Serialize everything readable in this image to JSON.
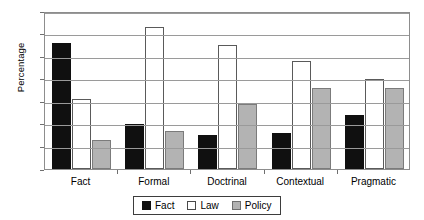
{
  "chart_data": {
    "type": "bar",
    "title": "",
    "xlabel": "",
    "ylabel": "Percentage",
    "ylim": [
      0,
      70
    ],
    "ytick_step": 10,
    "yticks": [
      0,
      10,
      20,
      30,
      40,
      50,
      60,
      70
    ],
    "grid": true,
    "legend_position": "bottom-center",
    "categories": [
      "Fact",
      "Formal",
      "Doctrinal",
      "Contextual",
      "Pragmatic"
    ],
    "series": [
      {
        "name": "Fact",
        "color": "#101010",
        "values": [
          56,
          20,
          15,
          16,
          24
        ]
      },
      {
        "name": "Law",
        "color": "#ffffff",
        "values": [
          31,
          63,
          55,
          48,
          40
        ]
      },
      {
        "name": "Policy",
        "color": "#b3b3b3",
        "values": [
          13,
          17,
          29,
          36,
          36
        ]
      }
    ]
  },
  "legend": {
    "items": [
      {
        "label": "Fact"
      },
      {
        "label": "Law"
      },
      {
        "label": "Policy"
      }
    ]
  }
}
